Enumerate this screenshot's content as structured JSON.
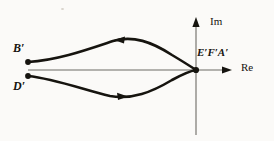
{
  "figure": {
    "type": "complex-plane-contour-diagram",
    "background_color": "#fbfaf8",
    "ink_color": "#16140f",
    "axis_color": "#6d6a64",
    "width": 274,
    "height": 141,
    "axes": {
      "real_axis_label": "Re",
      "imaginary_axis_label": "Im",
      "origin": {
        "x": 196,
        "y": 70
      },
      "real_axis": {
        "x_start": 28,
        "x_end": 232,
        "y": 70,
        "arrow": "right"
      },
      "imaginary_axis": {
        "x": 196,
        "y_start": 135,
        "y_end": 18,
        "arrow": "up"
      }
    },
    "points": [
      {
        "name": "B-prime",
        "label": "B′",
        "x": 28,
        "y": 62,
        "marker": "filled-dot"
      },
      {
        "name": "D-prime",
        "label": "D′",
        "x": 28,
        "y": 76,
        "marker": "filled-dot"
      },
      {
        "name": "EFA-prime",
        "label": "E′F′A′",
        "x": 196,
        "y": 70,
        "marker": "filled-dot"
      }
    ],
    "curves": [
      {
        "name": "upper-contour",
        "from": "B-prime",
        "to": "EFA-prime",
        "direction": "leftward",
        "arrow_direction": "left",
        "arrow_at": {
          "x": 122,
          "y": 40
        },
        "path": "M 28 62 C 58 60, 86 50, 113 41 C 133 35, 152 42, 172 55 C 182 61, 190 66, 196 70"
      },
      {
        "name": "lower-contour",
        "from": "D-prime",
        "to": "EFA-prime",
        "direction": "rightward",
        "arrow_direction": "right",
        "arrow_at": {
          "x": 120,
          "y": 96
        },
        "path": "M 28 76 C 56 79, 84 90, 110 96 C 132 100, 152 92, 172 80 C 183 74, 190 71, 196 70"
      }
    ],
    "labels": {
      "b_prime": "B′",
      "d_prime": "D′",
      "efa_prime": "E′F′A′",
      "im": "Im",
      "re": "Re"
    }
  }
}
